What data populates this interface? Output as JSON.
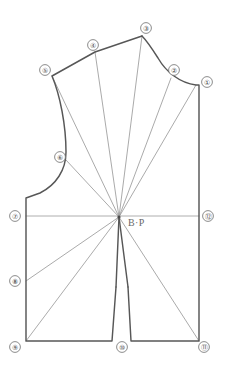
{
  "diagram": {
    "bust_point_label": "B·P",
    "markers": [
      {
        "id": "1",
        "label": "①",
        "x": 207,
        "y": 82,
        "anchor_x": 196,
        "anchor_y": 85
      },
      {
        "id": "2",
        "label": "②",
        "x": 174,
        "y": 70,
        "anchor_x": 171,
        "anchor_y": 78
      },
      {
        "id": "3",
        "label": "③",
        "x": 146,
        "y": 28,
        "anchor_x": 142,
        "anchor_y": 36
      },
      {
        "id": "4",
        "label": "④",
        "x": 93,
        "y": 45,
        "anchor_x": 95,
        "anchor_y": 52
      },
      {
        "id": "5",
        "label": "⑤",
        "x": 45,
        "y": 70,
        "anchor_x": 52,
        "anchor_y": 76
      },
      {
        "id": "6",
        "label": "⑥",
        "x": 60,
        "y": 157,
        "anchor_x": 66,
        "anchor_y": 160
      },
      {
        "id": "7",
        "label": "⑦",
        "x": 15,
        "y": 216,
        "anchor_x": 26,
        "anchor_y": 216
      },
      {
        "id": "8",
        "label": "⑧",
        "x": 15,
        "y": 281,
        "anchor_x": 26,
        "anchor_y": 281
      },
      {
        "id": "9",
        "label": "⑨",
        "x": 15,
        "y": 347,
        "anchor_x": 26,
        "anchor_y": 341
      },
      {
        "id": "10",
        "label": "⑩",
        "x": 122,
        "y": 347,
        "anchor_x": 122,
        "anchor_y": 341
      },
      {
        "id": "11",
        "label": "⑪",
        "x": 204,
        "y": 347,
        "anchor_x": 199,
        "anchor_y": 341
      },
      {
        "id": "12",
        "label": "⑫",
        "x": 208,
        "y": 216,
        "anchor_x": 199,
        "anchor_y": 216
      }
    ],
    "bust_point": {
      "x": 119,
      "y": 217
    },
    "colors": {
      "outline": "#575757",
      "dart_line": "#8e8e8e",
      "guide_line": "#9a9a9a",
      "marker_stroke": "#6f6f6f",
      "label_text": "#4a4a4a",
      "background": "#ffffff"
    },
    "geometry": {
      "outline_path": "M 142,36 L 95,52 L 52,76 C 60,95 66,125 66,152 C 66,170 56,185 40,193 L 26,198 L 26,341 L 112,341 L 116,287 M 128,287 L 131,341 L 199,341 L 199,85 L 196,85 C 180,83 166,72 158,58 C 151,47 146,40 142,36 Z",
      "bust_line": "M 26,216 L 199,216",
      "dart_rays": [
        "M 119,217 L 142,36",
        "M 119,217 L 95,52",
        "M 119,217 L 52,76",
        "M 119,217 L 66,160",
        "M 119,217 L 171,78",
        "M 119,217 L 196,85",
        "M 119,217 L 26,281",
        "M 119,217 L 26,341",
        "M 119,217 L 199,341",
        "M 119,217 L 116,287",
        "M 119,217 L 128,287"
      ]
    }
  }
}
